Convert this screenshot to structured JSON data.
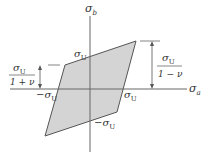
{
  "diagram": {
    "axes": {
      "horizontal": {
        "symbol": "σ",
        "subscript": "a"
      },
      "vertical": {
        "symbol": "σ",
        "subscript": "b"
      }
    },
    "intercepts": {
      "top": {
        "sign": "",
        "symbol": "σ",
        "subscript": "U"
      },
      "right": {
        "sign": "",
        "symbol": "σ",
        "subscript": "U"
      },
      "left": {
        "sign": "−",
        "symbol": "σ",
        "subscript": "U"
      },
      "bottom": {
        "sign": "−",
        "symbol": "σ",
        "subscript": "U"
      }
    },
    "dimensions": {
      "left": {
        "numerator": "σ",
        "numerator_sub": "U",
        "denominator": "1 + ν"
      },
      "right": {
        "numerator": "σ",
        "numerator_sub": "U",
        "denominator": "1 − ν"
      }
    },
    "colors": {
      "fill": "#d4d4d4",
      "stroke": "#555555",
      "axis": "#666666"
    }
  }
}
